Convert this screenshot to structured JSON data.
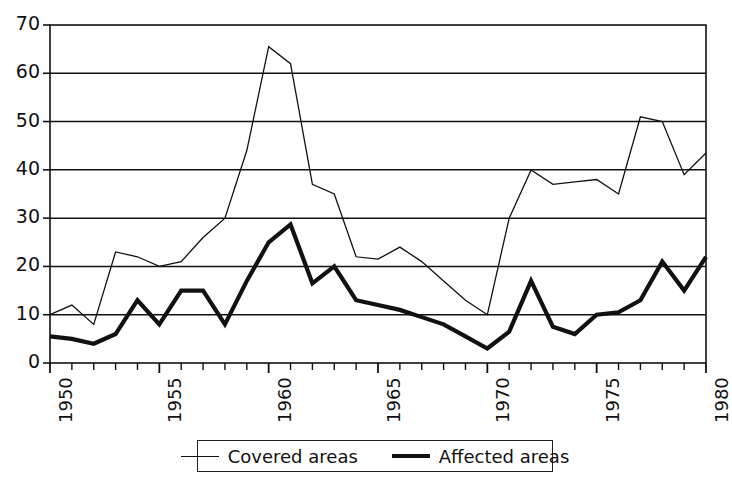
{
  "chart_data": {
    "type": "line",
    "title": "",
    "xlabel": "",
    "ylabel": "",
    "xlim": [
      1950,
      1980
    ],
    "ylim": [
      0,
      70
    ],
    "grid": true,
    "legend_position": "bottom",
    "x": [
      1950,
      1951,
      1952,
      1953,
      1954,
      1955,
      1956,
      1957,
      1958,
      1959,
      1960,
      1961,
      1962,
      1963,
      1964,
      1965,
      1966,
      1967,
      1968,
      1969,
      1970,
      1971,
      1972,
      1973,
      1974,
      1975,
      1976,
      1977,
      1978,
      1979,
      1980
    ],
    "y_ticks": [
      0,
      10,
      20,
      30,
      40,
      50,
      60,
      70
    ],
    "x_ticks": [
      1950,
      1955,
      1960,
      1965,
      1970,
      1975,
      1980
    ],
    "x_tick_labels": [
      "1950",
      "1955",
      "1960",
      "1965",
      "1970",
      "1975",
      "1980"
    ],
    "series": [
      {
        "name": "Covered areas",
        "style": "thin",
        "color": "#111111",
        "values": [
          10,
          12,
          8,
          23,
          22,
          20,
          21,
          26,
          30,
          44,
          65.5,
          62,
          37,
          35,
          22,
          21.5,
          24,
          21,
          17,
          13,
          10,
          30,
          40,
          37,
          37.5,
          38,
          35,
          51,
          50,
          39,
          43.5
        ]
      },
      {
        "name": "Affected areas",
        "style": "thick",
        "color": "#111111",
        "values": [
          5.5,
          5,
          4,
          6,
          13,
          8,
          15,
          15,
          8,
          17,
          25,
          28.7,
          16.5,
          20,
          13,
          12,
          11,
          9.5,
          8,
          5.5,
          3,
          6.5,
          17,
          7.5,
          6,
          10,
          10.5,
          13,
          21,
          15,
          22
        ]
      }
    ]
  },
  "legend": {
    "entries": [
      {
        "label": "Covered areas",
        "swatch": "thin-line-swatch"
      },
      {
        "label": "Affected areas",
        "swatch": "thick-line-swatch"
      }
    ]
  },
  "axes": {
    "y_labels": [
      "70",
      "60",
      "50",
      "40",
      "30",
      "20",
      "10",
      "0"
    ],
    "x_labels": [
      "1950",
      "1955",
      "1960",
      "1965",
      "1970",
      "1975",
      "1980"
    ]
  }
}
